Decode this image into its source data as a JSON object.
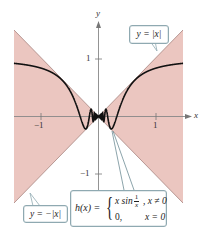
{
  "chart_data": {
    "type": "line",
    "title": "",
    "xlabel": "x",
    "ylabel": "y",
    "xlim": [
      -1.47,
      1.47
    ],
    "ylim": [
      -1.5,
      1.5
    ],
    "grid": false,
    "x_ticks": [
      -1,
      1
    ],
    "y_ticks": [
      1,
      -1
    ],
    "series": [
      {
        "name": "y = |x|",
        "expression": "|x|",
        "style": "boundary of shaded region (upper)"
      },
      {
        "name": "y = -|x|",
        "expression": "-|x|",
        "style": "boundary of shaded region (lower)"
      },
      {
        "name": "h(x)",
        "expression": "x sin(1/x), x ≠ 0; 0, x = 0",
        "style": "thick black curve",
        "sample_points": [
          {
            "x": -1.47,
            "y": 0.93
          },
          {
            "x": -1.0,
            "y": 0.84
          },
          {
            "x": -0.5,
            "y": 0.45
          },
          {
            "x": -0.318,
            "y": 0.0
          },
          {
            "x": -0.212,
            "y": -0.21
          },
          {
            "x": 0.0,
            "y": 0.0
          },
          {
            "x": 0.212,
            "y": -0.21
          },
          {
            "x": 0.318,
            "y": 0.0
          },
          {
            "x": 0.5,
            "y": 0.45
          },
          {
            "x": 1.0,
            "y": 0.84
          },
          {
            "x": 1.47,
            "y": 0.93
          }
        ]
      }
    ],
    "shaded_region": {
      "between": [
        "-|x|",
        "|x|"
      ],
      "color": "#ebc6c0"
    },
    "annotations": [
      {
        "text": "y = |x|",
        "target": "upper boundary line"
      },
      {
        "text": "y = −|x|",
        "target": "lower boundary line"
      },
      {
        "text": "h(x) = { x sin 1/x, x ≠ 0 ; 0, x = 0 }",
        "target": "oscillating curve near origin"
      }
    ]
  },
  "labels": {
    "x_axis": "x",
    "y_axis": "y",
    "x_tick_neg1": "−1",
    "x_tick_pos1": "1",
    "y_tick_pos1": "1",
    "y_tick_neg1": "−1"
  },
  "callouts": {
    "abs": "y = |x|",
    "negabs": "y = −|x|",
    "h_name": "h(x) =",
    "h_row1_expr": "x sin",
    "h_row1_frac_num": "1",
    "h_row1_frac_den": "x",
    "h_row1_cond": ", x ≠ 0",
    "h_row2_expr": "0,",
    "h_row2_cond": "x = 0"
  },
  "colors": {
    "shade": "#ebc6c0",
    "boundary": "#b08f8a",
    "curve": "#111111",
    "axis": "#888888",
    "callout_border": "#8fa9b1"
  }
}
